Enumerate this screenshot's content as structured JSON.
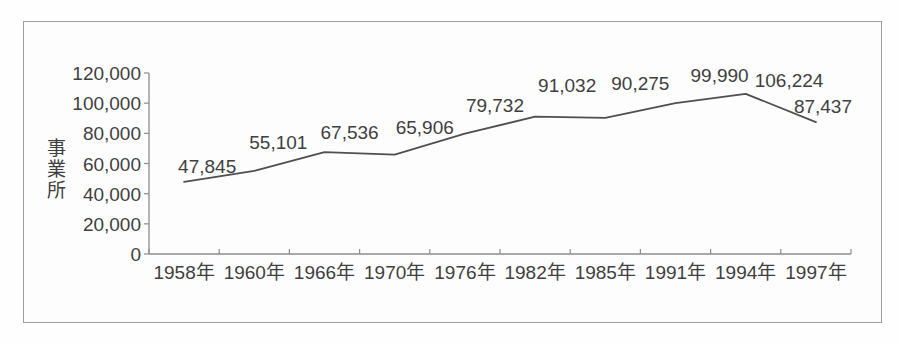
{
  "chart_data": {
    "type": "line",
    "title": "",
    "xlabel": "",
    "ylabel": "事業所",
    "categories": [
      "1958年",
      "1960年",
      "1966年",
      "1970年",
      "1976年",
      "1982年",
      "1985年",
      "1991年",
      "1994年",
      "1997年"
    ],
    "values": [
      47845,
      55101,
      67536,
      65906,
      79732,
      91032,
      90275,
      99990,
      106224,
      87437
    ],
    "data_labels": [
      "47,845",
      "55,101",
      "67,536",
      "65,906",
      "79,732",
      "91,032",
      "90,275",
      "99,990",
      "106,224",
      "87,437"
    ],
    "y_ticks": [
      0,
      20000,
      40000,
      60000,
      80000,
      100000,
      120000
    ],
    "y_tick_labels": [
      "0",
      "20,000",
      "40,000",
      "60,000",
      "80,000",
      "100,000",
      "120,000"
    ],
    "ylim": [
      0,
      120000
    ],
    "grid": "off",
    "legend": "none",
    "markers": "none",
    "colors": {
      "line": "#4f4f4f",
      "axis": "#8c8c8c",
      "text": "#3f3f3f",
      "frame_border": "#9d9d9d",
      "background": "#fdfdfd"
    }
  }
}
